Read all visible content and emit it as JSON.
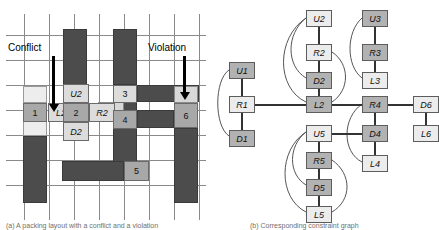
{
  "figure": {
    "panel_a": {
      "id": "a",
      "caption": "(a) A packing layout with a conflict and a violation",
      "annotations": [
        {
          "name": "conflict",
          "label": "Conflict"
        },
        {
          "name": "violation",
          "label": "Violation"
        }
      ],
      "piece_numbers": [
        "1",
        "2",
        "3",
        "4",
        "5",
        "6"
      ],
      "direction_labels": [
        "U2",
        "L2",
        "R2",
        "D2"
      ],
      "grid": {
        "cols": 8,
        "rows": 8
      }
    },
    "panel_b": {
      "id": "b",
      "caption": "(b) Corresponding constraint graph",
      "nodes": [
        {
          "id": "U1",
          "label": "U1",
          "shade": "dark",
          "x": 19,
          "y": 62
        },
        {
          "id": "R1",
          "label": "R1",
          "shade": "light",
          "x": 19,
          "y": 96
        },
        {
          "id": "D1",
          "label": "D1",
          "shade": "dark",
          "x": 19,
          "y": 130
        },
        {
          "id": "U2",
          "label": "U2",
          "shade": "light",
          "x": 96,
          "y": 10
        },
        {
          "id": "R2",
          "label": "R2",
          "shade": "light",
          "x": 96,
          "y": 44
        },
        {
          "id": "D2",
          "label": "D2",
          "shade": "dark",
          "x": 96,
          "y": 72
        },
        {
          "id": "L2",
          "label": "L2",
          "shade": "dark",
          "x": 96,
          "y": 96
        },
        {
          "id": "U3",
          "label": "U3",
          "shade": "dark",
          "x": 152,
          "y": 10
        },
        {
          "id": "R3",
          "label": "R3",
          "shade": "dark",
          "x": 152,
          "y": 44
        },
        {
          "id": "L3",
          "label": "L3",
          "shade": "light",
          "x": 152,
          "y": 72
        },
        {
          "id": "R4",
          "label": "R4",
          "shade": "dark",
          "x": 152,
          "y": 96
        },
        {
          "id": "D4",
          "label": "D4",
          "shade": "dark",
          "x": 152,
          "y": 125
        },
        {
          "id": "L4",
          "label": "L4",
          "shade": "light",
          "x": 152,
          "y": 155
        },
        {
          "id": "U5",
          "label": "U5",
          "shade": "light",
          "x": 96,
          "y": 125
        },
        {
          "id": "R5",
          "label": "R5",
          "shade": "dark",
          "x": 96,
          "y": 152
        },
        {
          "id": "D5",
          "label": "D5",
          "shade": "dark",
          "x": 96,
          "y": 179
        },
        {
          "id": "L5",
          "label": "L5",
          "shade": "light",
          "x": 96,
          "y": 206
        },
        {
          "id": "D6",
          "label": "D6",
          "shade": "light",
          "x": 203,
          "y": 96
        },
        {
          "id": "L6",
          "label": "L6",
          "shade": "light",
          "x": 203,
          "y": 125
        }
      ],
      "edges": [
        {
          "from": "U1",
          "to": "R1",
          "kind": "straight"
        },
        {
          "from": "R1",
          "to": "D1",
          "kind": "straight"
        },
        {
          "from": "U1",
          "to": "D1",
          "kind": "curve"
        },
        {
          "from": "R1",
          "to": "L2",
          "kind": "straight"
        },
        {
          "from": "U2",
          "to": "R2",
          "kind": "straight"
        },
        {
          "from": "R2",
          "to": "D2",
          "kind": "straight"
        },
        {
          "from": "D2",
          "to": "L2",
          "kind": "straight"
        },
        {
          "from": "U2",
          "to": "D2",
          "kind": "curve"
        },
        {
          "from": "U2",
          "to": "L2",
          "kind": "curve"
        },
        {
          "from": "R2",
          "to": "L2",
          "kind": "curve"
        },
        {
          "from": "U3",
          "to": "R3",
          "kind": "straight"
        },
        {
          "from": "R3",
          "to": "L3",
          "kind": "straight"
        },
        {
          "from": "U3",
          "to": "L3",
          "kind": "curve"
        },
        {
          "from": "L2",
          "to": "R4",
          "kind": "straight"
        },
        {
          "from": "R4",
          "to": "D4",
          "kind": "straight"
        },
        {
          "from": "D4",
          "to": "L4",
          "kind": "straight"
        },
        {
          "from": "R4",
          "to": "L4",
          "kind": "curve"
        },
        {
          "from": "U5",
          "to": "R5",
          "kind": "straight"
        },
        {
          "from": "R5",
          "to": "D5",
          "kind": "straight"
        },
        {
          "from": "D5",
          "to": "L5",
          "kind": "straight"
        },
        {
          "from": "U5",
          "to": "D5",
          "kind": "curve"
        },
        {
          "from": "U5",
          "to": "L5",
          "kind": "curve"
        },
        {
          "from": "R5",
          "to": "L5",
          "kind": "curve"
        },
        {
          "from": "U5",
          "to": "D4",
          "kind": "straight"
        },
        {
          "from": "R4",
          "to": "D6",
          "kind": "straight"
        },
        {
          "from": "D6",
          "to": "L6",
          "kind": "straight"
        }
      ]
    }
  },
  "colors": {
    "dark_piece": "#4c4c4c",
    "mid_piece": "#9a9a9a",
    "light_piece": "#d8d8d8",
    "very_light_piece": "#ededed",
    "gridline": "#8a8a8a",
    "node_dark": "#b2b2b2",
    "node_light": "#ececec",
    "edge": "#333333",
    "text": "#000000"
  }
}
